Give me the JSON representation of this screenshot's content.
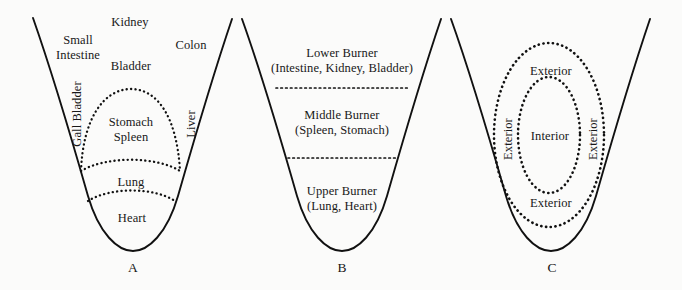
{
  "figure": {
    "title": "",
    "background_color": "#fbfbfa",
    "ink_color": "#111111",
    "panels": [
      {
        "id": "A",
        "letter": "A",
        "name": "organ-map-panel",
        "outside_labels": [
          {
            "name": "label-kidney",
            "text": "Kidney"
          },
          {
            "name": "label-small-intestine",
            "text": "Small\nIntestine"
          },
          {
            "name": "label-bladder",
            "text": "Bladder"
          },
          {
            "name": "label-colon",
            "text": "Colon"
          },
          {
            "name": "label-gall-bladder",
            "text": "Gall Bladder",
            "orientation": "vertical"
          },
          {
            "name": "label-liver",
            "text": "Liver",
            "orientation": "vertical"
          }
        ],
        "inside_labels": [
          {
            "name": "label-stomach-spleen",
            "text": "Stomach\nSpleen"
          },
          {
            "name": "label-lung",
            "text": "Lung"
          },
          {
            "name": "label-heart",
            "text": "Heart"
          }
        ]
      },
      {
        "id": "B",
        "letter": "B",
        "name": "triple-burner-panel",
        "zones": [
          {
            "name": "zone-lower-burner",
            "title": "Lower Burner",
            "contents": "(Intestine, Kidney, Bladder)"
          },
          {
            "name": "zone-middle-burner",
            "title": "Middle Burner",
            "contents": "(Spleen, Stomach)"
          },
          {
            "name": "zone-upper-burner",
            "title": "Upper Burner",
            "contents": "(Lung, Heart)"
          }
        ]
      },
      {
        "id": "C",
        "letter": "C",
        "name": "interior-exterior-panel",
        "regions": [
          {
            "name": "label-exterior-top",
            "text": "Exterior"
          },
          {
            "name": "label-exterior-left",
            "text": "Exterior",
            "orientation": "vertical"
          },
          {
            "name": "label-exterior-right",
            "text": "Exterior",
            "orientation": "vertical"
          },
          {
            "name": "label-exterior-bottom",
            "text": "Exterior"
          },
          {
            "name": "label-interior",
            "text": "Interior"
          }
        ]
      }
    ]
  },
  "labels": {
    "kidney": "Kidney",
    "small_intestine_1": "Small",
    "small_intestine_2": "Intestine",
    "bladder": "Bladder",
    "colon": "Colon",
    "gall_bladder": "Gall Bladder",
    "liver": "Liver",
    "stomach": "Stomach",
    "spleen": "Spleen",
    "lung": "Lung",
    "heart": "Heart",
    "lower_burner": "Lower Burner",
    "lower_burner_contents": "(Intestine, Kidney, Bladder)",
    "middle_burner": "Middle Burner",
    "middle_burner_contents": "(Spleen, Stomach)",
    "upper_burner": "Upper Burner",
    "upper_burner_contents": "(Lung, Heart)",
    "exterior_top": "Exterior",
    "exterior_left": "Exterior",
    "exterior_right": "Exterior",
    "exterior_bottom": "Exterior",
    "interior": "Interior",
    "panel_a": "A",
    "panel_b": "B",
    "panel_c": "C"
  }
}
